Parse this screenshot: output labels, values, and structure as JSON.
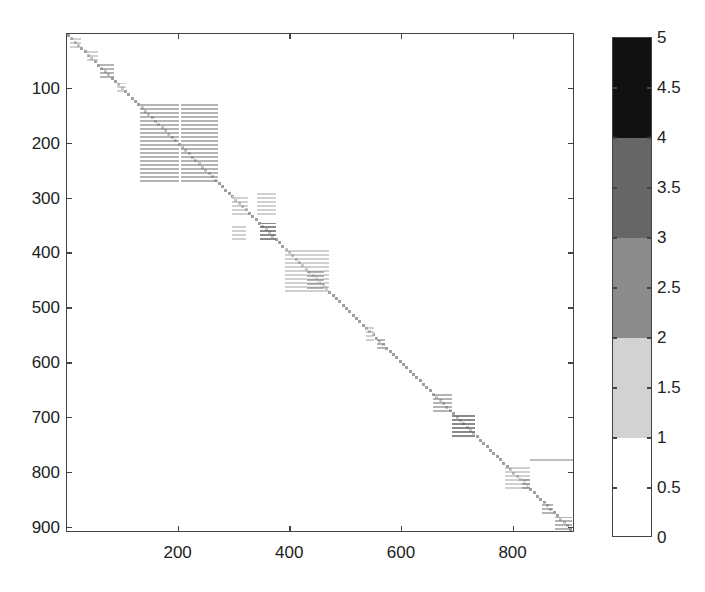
{
  "chart_data": {
    "type": "heatmap",
    "title": "",
    "xlabel": "",
    "ylabel": "",
    "x_range": [
      0,
      910
    ],
    "y_range": [
      0,
      910
    ],
    "y_reversed": true,
    "grid": false,
    "x_ticks": [
      200,
      400,
      600,
      800
    ],
    "y_ticks": [
      100,
      200,
      300,
      400,
      500,
      600,
      700,
      800,
      900
    ],
    "colorbar": {
      "range": [
        0,
        5
      ],
      "ticks": [
        "0",
        "0.5",
        "1",
        "1.5",
        "2",
        "2.5",
        "3",
        "3.5",
        "4",
        "4.5",
        "5"
      ],
      "bands": [
        {
          "from": 0,
          "to": 1,
          "color": "#ffffff"
        },
        {
          "from": 1,
          "to": 2,
          "color": "#d2d2d2"
        },
        {
          "from": 2,
          "to": 3,
          "color": "#8c8c8c"
        },
        {
          "from": 3,
          "to": 4,
          "color": "#666666"
        },
        {
          "from": 4,
          "to": 5,
          "color": "#111111"
        }
      ],
      "position": "right"
    },
    "blocks": [
      {
        "x0": 5,
        "x1": 25,
        "y0": 5,
        "y1": 25,
        "level": 1
      },
      {
        "x0": 35,
        "x1": 55,
        "y0": 30,
        "y1": 50,
        "level": 1
      },
      {
        "x0": 60,
        "x1": 85,
        "y0": 55,
        "y1": 80,
        "level": 2
      },
      {
        "x0": 90,
        "x1": 105,
        "y0": 90,
        "y1": 105,
        "level": 1
      },
      {
        "x0": 130,
        "x1": 200,
        "y0": 125,
        "y1": 270,
        "level": 2
      },
      {
        "x0": 205,
        "x1": 270,
        "y0": 125,
        "y1": 270,
        "level": 2
      },
      {
        "x0": 295,
        "x1": 325,
        "y0": 295,
        "y1": 330,
        "level": 1
      },
      {
        "x0": 340,
        "x1": 375,
        "y0": 290,
        "y1": 330,
        "level": 1
      },
      {
        "x0": 295,
        "x1": 320,
        "y0": 350,
        "y1": 375,
        "level": 1
      },
      {
        "x0": 345,
        "x1": 375,
        "y0": 345,
        "y1": 375,
        "level": 3
      },
      {
        "x0": 390,
        "x1": 470,
        "y0": 390,
        "y1": 470,
        "level": 1
      },
      {
        "x0": 430,
        "x1": 460,
        "y0": 430,
        "y1": 465,
        "level": 2
      },
      {
        "x0": 535,
        "x1": 550,
        "y0": 535,
        "y1": 560,
        "level": 1
      },
      {
        "x0": 555,
        "x1": 570,
        "y0": 555,
        "y1": 575,
        "level": 2
      },
      {
        "x0": 655,
        "x1": 690,
        "y0": 655,
        "y1": 690,
        "level": 2
      },
      {
        "x0": 690,
        "x1": 730,
        "y0": 695,
        "y1": 735,
        "level": 3
      },
      {
        "x0": 785,
        "x1": 830,
        "y0": 790,
        "y1": 830,
        "level": 1
      },
      {
        "x0": 815,
        "x1": 830,
        "y0": 810,
        "y1": 830,
        "level": 2
      },
      {
        "x0": 850,
        "x1": 870,
        "y0": 855,
        "y1": 875,
        "level": 2
      },
      {
        "x0": 875,
        "x1": 905,
        "y0": 880,
        "y1": 905,
        "level": 2
      }
    ]
  }
}
